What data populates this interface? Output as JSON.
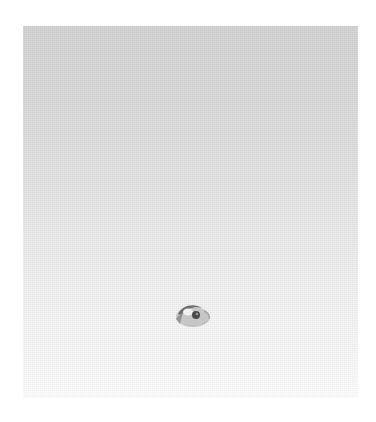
{
  "panel": {
    "gradient_top": "#d2d2d2",
    "gradient_bottom": "#fdfdfd"
  },
  "icon": {
    "name": "eye-icon",
    "color": "#707070"
  }
}
